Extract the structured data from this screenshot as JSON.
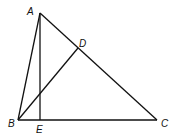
{
  "diagram": {
    "type": "geometry",
    "points": {
      "A": {
        "label": "A",
        "x": 40,
        "y": 13,
        "label_x": 27,
        "label_y": 15
      },
      "B": {
        "label": "B",
        "x": 18,
        "y": 120,
        "label_x": 8,
        "label_y": 127
      },
      "C": {
        "label": "C",
        "x": 157,
        "y": 120,
        "label_x": 161,
        "label_y": 127
      },
      "D": {
        "label": "D",
        "x": 78,
        "y": 48,
        "label_x": 79,
        "label_y": 47
      },
      "E": {
        "label": "E",
        "x": 40,
        "y": 120,
        "label_x": 36,
        "label_y": 133
      }
    },
    "segments": [
      {
        "from": "A",
        "to": "B"
      },
      {
        "from": "A",
        "to": "C"
      },
      {
        "from": "B",
        "to": "C"
      },
      {
        "from": "A",
        "to": "E"
      },
      {
        "from": "B",
        "to": "D"
      }
    ],
    "line_color": "#111111"
  }
}
